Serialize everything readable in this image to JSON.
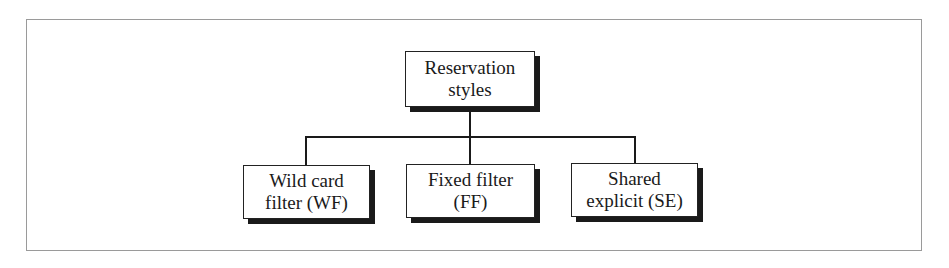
{
  "diagram": {
    "type": "tree",
    "root": {
      "id": "root",
      "lines": [
        "Reservation",
        "styles"
      ]
    },
    "children": [
      {
        "id": "wf",
        "lines": [
          "Wild card",
          "filter (WF)"
        ]
      },
      {
        "id": "ff",
        "lines": [
          "Fixed filter",
          "(FF)"
        ]
      },
      {
        "id": "se",
        "lines": [
          "Shared",
          "explicit (SE)"
        ]
      }
    ],
    "edges": [
      {
        "from": "root",
        "to": "wf"
      },
      {
        "from": "root",
        "to": "ff"
      },
      {
        "from": "root",
        "to": "se"
      }
    ],
    "colors": {
      "frame": "#9a9a9a",
      "box_border": "#222222",
      "shadow": "#1a1a1a",
      "background": "#ffffff"
    }
  }
}
